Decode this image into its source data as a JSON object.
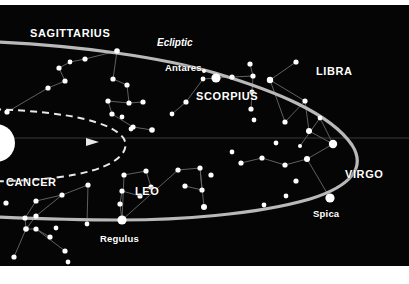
{
  "figure": {
    "kind": "star-chart",
    "background_color": "#050505",
    "margin_color": "#ffffff",
    "star_color": "#ffffff",
    "ecliptic_color": "#b9b9b9",
    "orbit_color": "#e8e8e8",
    "constellation_line_color": "#6a6a6a",
    "horizon_line_color": "#3a3a3a"
  },
  "constellations": [
    {
      "id": "sagittarius",
      "label": "SAGITTARIUS",
      "x": 30,
      "y": 22
    },
    {
      "id": "scorpius",
      "label": "SCORPIUS",
      "x": 196,
      "y": 85
    },
    {
      "id": "libra",
      "label": "LIBRA",
      "x": 316,
      "y": 60
    },
    {
      "id": "virgo",
      "label": "VIRGO",
      "x": 345,
      "y": 163
    },
    {
      "id": "leo",
      "label": "LEO",
      "x": 135,
      "y": 180
    },
    {
      "id": "cancer",
      "label": "CANCER",
      "x": 6,
      "y": 171
    }
  ],
  "named_stars": [
    {
      "id": "antares",
      "label": "Antares",
      "label_x": 165,
      "label_y": 57,
      "star_x": 216,
      "star_y": 73,
      "radius": 4.6
    },
    {
      "id": "regulus",
      "label": "Regulus",
      "label_x": 100,
      "label_y": 228,
      "star_x": 122,
      "star_y": 215,
      "radius": 4.6
    },
    {
      "id": "spica",
      "label": "Spica",
      "label_x": 313,
      "label_y": 203,
      "star_x": 330,
      "star_y": 193,
      "radius": 4.6
    }
  ],
  "paths": [
    {
      "id": "ecliptic",
      "label": "Ecliptic",
      "label_x": 157,
      "label_y": 32,
      "style": "solid",
      "width": 3.2
    },
    {
      "id": "earth-orbit",
      "label": "",
      "style": "dashed",
      "width": 2
    }
  ],
  "sun": {
    "id": "sun",
    "x": -4,
    "y": 138,
    "radius": 19
  },
  "stars": [
    {
      "x": 117,
      "y": 46,
      "r": 2.8
    },
    {
      "x": 85,
      "y": 54,
      "r": 2.6
    },
    {
      "x": 70,
      "y": 57,
      "r": 2.4
    },
    {
      "x": 59,
      "y": 63,
      "r": 2.6
    },
    {
      "x": 65,
      "y": 76,
      "r": 2.6
    },
    {
      "x": 48,
      "y": 83,
      "r": 2.6
    },
    {
      "x": 113,
      "y": 74,
      "r": 2.6
    },
    {
      "x": 127,
      "y": 80,
      "r": 2.6
    },
    {
      "x": 108,
      "y": 96,
      "r": 2.6
    },
    {
      "x": 129,
      "y": 98,
      "r": 2.6
    },
    {
      "x": 143,
      "y": 97,
      "r": 2.6
    },
    {
      "x": 112,
      "y": 109,
      "r": 2.6
    },
    {
      "x": 122,
      "y": 112,
      "r": 2.4
    },
    {
      "x": 133,
      "y": 122,
      "r": 2.6
    },
    {
      "x": 7,
      "y": 107,
      "r": 2.6
    },
    {
      "x": 131,
      "y": 124,
      "r": 2.4
    },
    {
      "x": 152,
      "y": 125,
      "r": 2.8
    },
    {
      "x": 186,
      "y": 97,
      "r": 2.6
    },
    {
      "x": 172,
      "y": 109,
      "r": 2.4
    },
    {
      "x": 203,
      "y": 74,
      "r": 2.4
    },
    {
      "x": 232,
      "y": 72,
      "r": 2.6
    },
    {
      "x": 253,
      "y": 71,
      "r": 2.6
    },
    {
      "x": 250,
      "y": 59,
      "r": 2.6
    },
    {
      "x": 252,
      "y": 87,
      "r": 2.6
    },
    {
      "x": 251,
      "y": 104,
      "r": 2.6
    },
    {
      "x": 204,
      "y": 66,
      "r": 2.0
    },
    {
      "x": 296,
      "y": 57,
      "r": 2.6
    },
    {
      "x": 270,
      "y": 75,
      "r": 3.2
    },
    {
      "x": 305,
      "y": 96,
      "r": 2.6
    },
    {
      "x": 285,
      "y": 117,
      "r": 2.6
    },
    {
      "x": 309,
      "y": 126,
      "r": 3.0
    },
    {
      "x": 333,
      "y": 139,
      "r": 4.2
    },
    {
      "x": 307,
      "y": 154,
      "r": 3.0
    },
    {
      "x": 285,
      "y": 160,
      "r": 2.6
    },
    {
      "x": 262,
      "y": 153,
      "r": 2.6
    },
    {
      "x": 241,
      "y": 158,
      "r": 2.6
    },
    {
      "x": 296,
      "y": 176,
      "r": 2.6
    },
    {
      "x": 276,
      "y": 138,
      "r": 2.4
    },
    {
      "x": 300,
      "y": 141,
      "r": 2.0
    },
    {
      "x": 254,
      "y": 115,
      "r": 2.4
    },
    {
      "x": 320,
      "y": 113,
      "r": 2.4
    },
    {
      "x": 232,
      "y": 147,
      "r": 2.4
    },
    {
      "x": 211,
      "y": 170,
      "r": 2.6
    },
    {
      "x": 124,
      "y": 170,
      "r": 2.6
    },
    {
      "x": 146,
      "y": 166,
      "r": 2.6
    },
    {
      "x": 151,
      "y": 182,
      "r": 2.6
    },
    {
      "x": 140,
      "y": 191,
      "r": 2.6
    },
    {
      "x": 122,
      "y": 186,
      "r": 2.6
    },
    {
      "x": 120,
      "y": 199,
      "r": 2.6
    },
    {
      "x": 178,
      "y": 165,
      "r": 2.6
    },
    {
      "x": 200,
      "y": 163,
      "r": 2.6
    },
    {
      "x": 185,
      "y": 181,
      "r": 2.6
    },
    {
      "x": 202,
      "y": 185,
      "r": 2.6
    },
    {
      "x": 204,
      "y": 202,
      "r": 3.0
    },
    {
      "x": 88,
      "y": 180,
      "r": 2.6
    },
    {
      "x": 62,
      "y": 190,
      "r": 2.6
    },
    {
      "x": 36,
      "y": 196,
      "r": 2.6
    },
    {
      "x": 6,
      "y": 198,
      "r": 2.6
    },
    {
      "x": 25,
      "y": 213,
      "r": 2.6
    },
    {
      "x": 36,
      "y": 211,
      "r": 2.6
    },
    {
      "x": 26,
      "y": 224,
      "r": 2.8
    },
    {
      "x": 36,
      "y": 224,
      "r": 2.6
    },
    {
      "x": 50,
      "y": 232,
      "r": 2.6
    },
    {
      "x": 65,
      "y": 246,
      "r": 2.6
    },
    {
      "x": 14,
      "y": 252,
      "r": 2.6
    },
    {
      "x": 56,
      "y": 223,
      "r": 2.4
    },
    {
      "x": 87,
      "y": 219,
      "r": 2.4
    },
    {
      "x": 68,
      "y": 257,
      "r": 2.4
    },
    {
      "x": 286,
      "y": 191,
      "r": 2.4
    },
    {
      "x": 264,
      "y": 200,
      "r": 2.4
    }
  ],
  "constellation_lines": [
    [
      85,
      54,
      117,
      46
    ],
    [
      85,
      54,
      70,
      57
    ],
    [
      70,
      57,
      59,
      63
    ],
    [
      59,
      63,
      65,
      76
    ],
    [
      65,
      76,
      48,
      83
    ],
    [
      117,
      46,
      113,
      74
    ],
    [
      113,
      74,
      127,
      80
    ],
    [
      127,
      80,
      129,
      98
    ],
    [
      129,
      98,
      143,
      97
    ],
    [
      108,
      96,
      112,
      109
    ],
    [
      112,
      109,
      133,
      122
    ],
    [
      133,
      122,
      152,
      125
    ],
    [
      129,
      98,
      108,
      96
    ],
    [
      48,
      83,
      7,
      107
    ],
    [
      216,
      73,
      203,
      74
    ],
    [
      216,
      73,
      232,
      72
    ],
    [
      232,
      72,
      253,
      71
    ],
    [
      253,
      71,
      250,
      59
    ],
    [
      253,
      71,
      252,
      87
    ],
    [
      252,
      87,
      251,
      104
    ],
    [
      203,
      74,
      186,
      97
    ],
    [
      186,
      97,
      172,
      109
    ],
    [
      296,
      57,
      270,
      75
    ],
    [
      270,
      75,
      305,
      96
    ],
    [
      305,
      96,
      285,
      117
    ],
    [
      285,
      117,
      270,
      75
    ],
    [
      305,
      96,
      309,
      126
    ],
    [
      309,
      126,
      333,
      139
    ],
    [
      333,
      139,
      307,
      154
    ],
    [
      307,
      154,
      330,
      193
    ],
    [
      307,
      154,
      285,
      160
    ],
    [
      285,
      160,
      262,
      153
    ],
    [
      262,
      153,
      241,
      158
    ],
    [
      333,
      139,
      320,
      113
    ],
    [
      320,
      113,
      300,
      141
    ],
    [
      124,
      170,
      146,
      166
    ],
    [
      146,
      166,
      151,
      182
    ],
    [
      151,
      182,
      140,
      191
    ],
    [
      140,
      191,
      122,
      186
    ],
    [
      122,
      186,
      120,
      199
    ],
    [
      120,
      199,
      122,
      215
    ],
    [
      122,
      215,
      124,
      170
    ],
    [
      122,
      215,
      178,
      165
    ],
    [
      178,
      165,
      200,
      163
    ],
    [
      200,
      163,
      202,
      185
    ],
    [
      202,
      185,
      185,
      181
    ],
    [
      200,
      163,
      204,
      202
    ],
    [
      88,
      180,
      62,
      190
    ],
    [
      62,
      190,
      36,
      196
    ],
    [
      36,
      196,
      25,
      213
    ],
    [
      25,
      213,
      26,
      224
    ],
    [
      26,
      224,
      36,
      224
    ],
    [
      36,
      224,
      50,
      232
    ],
    [
      26,
      224,
      14,
      252
    ],
    [
      36,
      211,
      26,
      224
    ],
    [
      62,
      190,
      36,
      211
    ],
    [
      36,
      224,
      65,
      246
    ],
    [
      88,
      180,
      87,
      219
    ]
  ]
}
